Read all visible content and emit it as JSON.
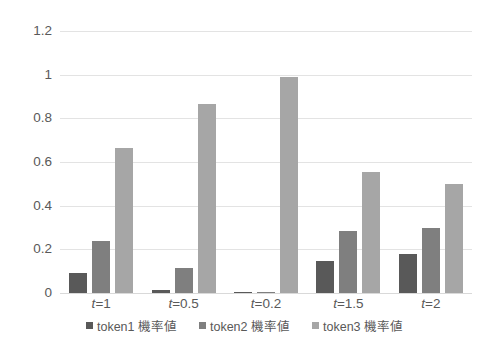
{
  "chart_data": {
    "type": "bar",
    "title": "",
    "subtitle": "",
    "xlabel": "",
    "ylabel": "",
    "categories": [
      "t =1",
      "t =0.5",
      "t =0.2",
      "t =1.5",
      "t =2"
    ],
    "category_parts": [
      {
        "var": "t",
        "rest": "=1"
      },
      {
        "var": "t",
        "rest": "=0.5"
      },
      {
        "var": "t",
        "rest": "=0.2"
      },
      {
        "var": "t",
        "rest": "=1.5"
      },
      {
        "var": "t",
        "rest": "=2"
      }
    ],
    "series": [
      {
        "name": "token1 機率値",
        "color": "#595959",
        "values": [
          0.09,
          0.015,
          0.003,
          0.145,
          0.18
        ]
      },
      {
        "name": "token2 機率値",
        "color": "#7f7f7f",
        "values": [
          0.24,
          0.115,
          0.005,
          0.285,
          0.3
        ]
      },
      {
        "name": "token3 機率値",
        "color": "#a6a6a6",
        "values": [
          0.665,
          0.865,
          0.99,
          0.555,
          0.5
        ]
      }
    ],
    "yticks": [
      "0",
      "0.2",
      "0.4",
      "0.6",
      "0.8",
      "1",
      "1.2"
    ],
    "ytick_values": [
      0,
      0.2,
      0.4,
      0.6,
      0.8,
      1,
      1.2
    ],
    "ylim": [
      0,
      1.2
    ],
    "grid": true,
    "legend_position": "bottom",
    "colors": {
      "grid": "#e3e3e3",
      "axis": "#d9d9d9",
      "text": "#595959",
      "background": "#ffffff"
    }
  }
}
